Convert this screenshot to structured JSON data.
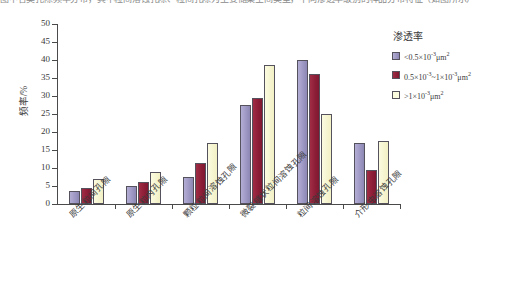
{
  "top_caption": "图中各类孔隙频率分布，其中粒间溶蚀孔隙、粒间孔隙为主要储集空间类型，不同渗透率级别的样品分布特征（如图所示）",
  "chart_data": {
    "type": "bar",
    "title": "",
    "xlabel": "",
    "ylabel": "频率/%",
    "ylim": [
      0,
      50
    ],
    "ytick_step": 5,
    "yticks": [
      "0",
      "5",
      "10",
      "15",
      "20",
      "25",
      "30",
      "35",
      "40",
      "45",
      "50"
    ],
    "grid": false,
    "legend_position": "right",
    "legend_title": "渗透率",
    "categories": [
      "原生粒间孔隙",
      "原生粒内孔隙",
      "颗粒粒间溶蚀孔隙",
      "微裂缝状粒间溶蚀孔隙",
      "粒间溶蚀孔隙",
      "介形虫溶蚀孔隙"
    ],
    "series": [
      {
        "name": "<0.5×10⁻³μm²",
        "name_html": "&lt;0.5&times;10<sup>-3</sup>&mu;m<sup>2</sup>",
        "color": "#a29cc8",
        "values": [
          3.5,
          5.0,
          7.5,
          27.5,
          40.0,
          17.0
        ]
      },
      {
        "name": "0.5×10⁻³~1×10⁻³μm²",
        "name_html": "0.5&times;10<sup>-3</sup>~1&times;10<sup>-3</sup>&mu;m<sup>2</sup>",
        "color": "#92203a",
        "values": [
          4.5,
          6.0,
          11.5,
          29.5,
          36.0,
          9.5
        ]
      },
      {
        "name": ">1×10⁻³μm²",
        "name_html": "&gt;1&times;10<sup>-3</sup>&mu;m<sup>2</sup>",
        "color": "#f7f6d4",
        "values": [
          7.0,
          9.0,
          17.0,
          38.5,
          25.0,
          17.5
        ]
      }
    ]
  }
}
